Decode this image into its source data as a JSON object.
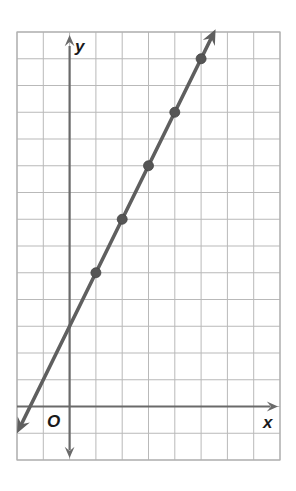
{
  "chart_data": {
    "type": "line",
    "title": "",
    "xlabel": "x",
    "ylabel": "y",
    "origin_label": "O",
    "xlim": [
      -2,
      8
    ],
    "ylim": [
      -2,
      14
    ],
    "grid": true,
    "grid_step": 1,
    "legend": null,
    "series": [
      {
        "name": "line",
        "equation": "y = 2x + 3",
        "slope": 2,
        "y_intercept": 3,
        "arrows_both_ends": true,
        "points": [
          {
            "x": 1,
            "y": 5
          },
          {
            "x": 2,
            "y": 7
          },
          {
            "x": 3,
            "y": 9
          },
          {
            "x": 4,
            "y": 11
          },
          {
            "x": 5,
            "y": 13
          }
        ],
        "line_extent": {
          "x_start": -2,
          "x_end": 5.55
        }
      }
    ]
  },
  "colors": {
    "grid": "#b9b9b9",
    "axis": "#6a6a6a",
    "line": "#5f5f5f",
    "point": "#555555",
    "border": "#b0b0b0"
  },
  "labels": {
    "x_axis": "x",
    "y_axis": "y",
    "origin": "O"
  }
}
